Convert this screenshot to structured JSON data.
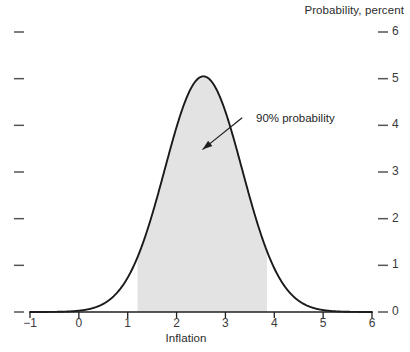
{
  "chart_data": {
    "type": "area",
    "title": "Probability, percent",
    "xlabel": "Inflation",
    "ylabel": "",
    "xlim": [
      -1,
      6
    ],
    "ylim": [
      0,
      6
    ],
    "grid": false,
    "legend_position": "none",
    "xticks": [
      "−1",
      "0",
      "1",
      "2",
      "3",
      "4",
      "5",
      "6"
    ],
    "xtick_values": [
      -1,
      0,
      1,
      2,
      3,
      4,
      5,
      6
    ],
    "yticks_right": [
      "6",
      "5",
      "4",
      "3",
      "2",
      "1",
      "0"
    ],
    "ytick_values_right": [
      6,
      5,
      4,
      3,
      2,
      1,
      0
    ],
    "yticks_left": [
      "",
      "",
      "",
      "",
      "",
      "",
      ""
    ],
    "series": [
      {
        "name": "Probability density of inflation",
        "kind": "line",
        "color": "#1a1a1a",
        "distribution": "normal",
        "mean": 2.55,
        "std_dev": 0.79,
        "peak_value": 5.05,
        "x": [
          -1.0,
          -0.8,
          -0.6,
          -0.4,
          -0.2,
          0.0,
          0.2,
          0.4,
          0.6,
          0.8,
          1.0,
          1.2,
          1.4,
          1.6,
          1.8,
          2.0,
          2.2,
          2.4,
          2.55,
          2.7,
          2.9,
          3.1,
          3.3,
          3.5,
          3.7,
          3.9,
          4.1,
          4.3,
          4.5,
          4.7,
          4.9,
          5.1,
          5.3,
          5.5,
          5.7,
          5.9,
          6.0
        ],
        "y": [
          0.0,
          0.0,
          0.01,
          0.02,
          0.04,
          0.07,
          0.13,
          0.22,
          0.37,
          0.58,
          0.88,
          1.27,
          1.76,
          2.32,
          2.93,
          3.55,
          4.12,
          4.6,
          5.05,
          4.92,
          4.52,
          3.96,
          3.32,
          2.65,
          2.02,
          1.46,
          1.0,
          0.65,
          0.4,
          0.23,
          0.13,
          0.07,
          0.03,
          0.01,
          0.01,
          0.0,
          0.0
        ]
      }
    ],
    "shaded_region": {
      "label": "90% probability",
      "x_start": 1.2,
      "x_end": 3.85,
      "fill_color": "#e3e3e3"
    },
    "annotations": [
      {
        "text": "90% probability",
        "text_x": 3.67,
        "text_y": 4.12,
        "arrow_tip_x": 2.53,
        "arrow_tip_y": 3.48
      }
    ]
  }
}
